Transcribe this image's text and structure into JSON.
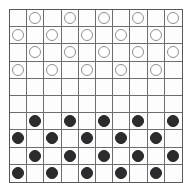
{
  "board": {
    "title": "Draughts board",
    "game": "International draughts",
    "rows": 10,
    "columns": 10,
    "colors": {
      "background": "#ffffff",
      "board_background": "#fdfdfd",
      "outer_border": "#58585a",
      "grid_line": "#6e6e70",
      "light_piece_fill": "#ffffff",
      "light_piece_outline": "#909093",
      "dark_piece_fill": "#2c2c2e",
      "dark_piece_outline": "#242426"
    },
    "legend": {
      "light_piece": "white-draughts-piece",
      "dark_piece": "black-draughts-piece",
      "empty": "empty-square"
    },
    "counts": {
      "light_pieces": 20,
      "dark_pieces": 20,
      "empty_squares": 60
    },
    "cells": [
      [
        "empty",
        "light",
        "empty",
        "light",
        "empty",
        "light",
        "empty",
        "light",
        "empty",
        "light"
      ],
      [
        "light",
        "empty",
        "light",
        "empty",
        "light",
        "empty",
        "light",
        "empty",
        "light",
        "empty"
      ],
      [
        "empty",
        "light",
        "empty",
        "light",
        "empty",
        "light",
        "empty",
        "light",
        "empty",
        "light"
      ],
      [
        "light",
        "empty",
        "light",
        "empty",
        "light",
        "empty",
        "light",
        "empty",
        "light",
        "empty"
      ],
      [
        "empty",
        "empty",
        "empty",
        "empty",
        "empty",
        "empty",
        "empty",
        "empty",
        "empty",
        "empty"
      ],
      [
        "empty",
        "empty",
        "empty",
        "empty",
        "empty",
        "empty",
        "empty",
        "empty",
        "empty",
        "empty"
      ],
      [
        "empty",
        "dark",
        "empty",
        "dark",
        "empty",
        "dark",
        "empty",
        "dark",
        "empty",
        "dark"
      ],
      [
        "dark",
        "empty",
        "dark",
        "empty",
        "dark",
        "empty",
        "dark",
        "empty",
        "dark",
        "empty"
      ],
      [
        "empty",
        "dark",
        "empty",
        "dark",
        "empty",
        "dark",
        "empty",
        "dark",
        "empty",
        "dark"
      ],
      [
        "dark",
        "empty",
        "dark",
        "empty",
        "dark",
        "empty",
        "dark",
        "empty",
        "dark",
        "empty"
      ]
    ]
  }
}
